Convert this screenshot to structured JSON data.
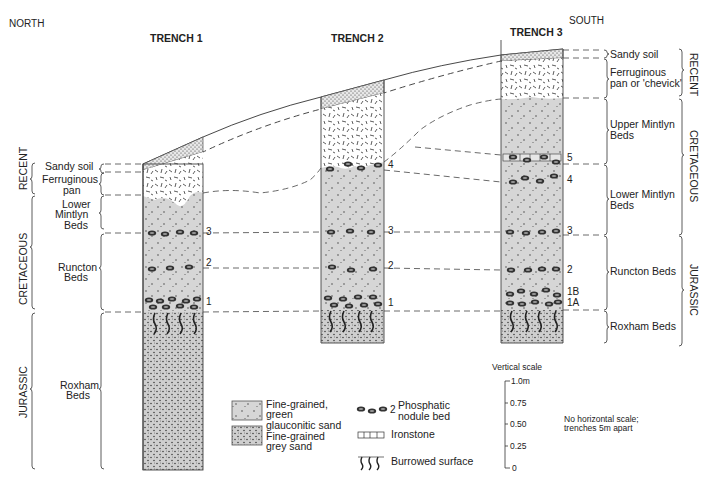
{
  "directions": {
    "north": "NORTH",
    "south": "SOUTH"
  },
  "trenches": [
    {
      "label": "TRENCH 1"
    },
    {
      "label": "TRENCH 2"
    },
    {
      "label": "TRENCH 3"
    }
  ],
  "left_beds": {
    "sandy_soil": "Sandy soil",
    "ferruginous_pan": [
      "Ferruginous",
      "pan"
    ],
    "lower_mintlyn": [
      "Lower",
      "Mintlyn",
      "Beds"
    ],
    "runcton": [
      "Runcton",
      "Beds"
    ],
    "roxham": [
      "Roxham",
      "Beds"
    ]
  },
  "left_periods": {
    "recent": "RECENT",
    "cretaceous": "CRETACEOUS",
    "jurassic": "JURASSIC"
  },
  "right_beds": {
    "sandy_soil": "Sandy soil",
    "ferruginous_pan": [
      "Ferruginous",
      "pan or 'chevick'"
    ],
    "upper_mintlyn": [
      "Upper Mintlyn",
      "Beds"
    ],
    "lower_mintlyn": [
      "Lower Mintlyn",
      "Beds"
    ],
    "runcton": "Runcton Beds",
    "roxham": "Roxham Beds"
  },
  "right_periods": {
    "recent": "RECENT",
    "cretaceous": "CRETACEOUS",
    "jurassic": "JURASSIC"
  },
  "nodule_bed_numbers": {
    "trench1": [
      "3",
      "2",
      "1"
    ],
    "trench2": [
      "4",
      "3",
      "2",
      "1"
    ],
    "trench3": [
      "5",
      "4",
      "3",
      "2",
      "1B",
      "1A"
    ]
  },
  "legend": {
    "green_sand": [
      "Fine-grained,",
      "green",
      "glauconitic sand"
    ],
    "grey_sand": [
      "Fine-grained",
      "grey sand"
    ],
    "nodule_num": "2",
    "nodule": [
      "Phosphatic",
      "nodule bed"
    ],
    "ironstone": "Ironstone",
    "burrowed": "Burrowed surface"
  },
  "scale": {
    "title": "Vertical scale",
    "ticks": [
      "1.0m",
      "0.75",
      "0.50",
      "0.25",
      "0"
    ],
    "note": [
      "No horizontal scale;",
      "trenches 5m apart"
    ]
  },
  "colors": {
    "green_sand": "#d4d4d4",
    "grey_sand": "#d0d0d0",
    "line": "#333333"
  }
}
